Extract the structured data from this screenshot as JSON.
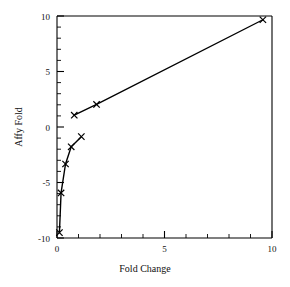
{
  "chart_data": {
    "type": "line",
    "title": "",
    "subtitle": "",
    "xlabel": "Fold  Change",
    "ylabel": "Affy Fold",
    "xlim": [
      0,
      10.6
    ],
    "ylim": [
      -10.5,
      10.2
    ],
    "grid": false,
    "legend": null,
    "legend_position": "none",
    "marker": "x",
    "xticks": [
      0,
      5,
      10
    ],
    "xtick_labels": [
      "0",
      "5",
      "10"
    ],
    "x_minor_ticks": [
      1,
      2,
      3,
      4,
      6,
      7,
      8,
      9
    ],
    "yticks": [
      10,
      5,
      0,
      -5,
      -10
    ],
    "ytick_labels": [
      "10",
      "5",
      "0",
      "-5",
      "-10"
    ],
    "y_minor_ticks": [
      9,
      8,
      7,
      6,
      4,
      3,
      2,
      1,
      -1,
      -2,
      -3,
      -4,
      -6,
      -7,
      -8,
      -9
    ],
    "series": [
      {
        "name": "upregulated",
        "points": [
          {
            "x": 0.85,
            "y": 0.95
          },
          {
            "x": 1.95,
            "y": 1.95
          },
          {
            "x": 10.15,
            "y": 9.85
          }
        ]
      },
      {
        "name": "downregulated",
        "points": [
          {
            "x": 0.12,
            "y": -10.0
          },
          {
            "x": 0.2,
            "y": -6.3
          },
          {
            "x": 0.42,
            "y": -3.6
          },
          {
            "x": 0.7,
            "y": -2.0
          },
          {
            "x": 1.2,
            "y": -1.05
          }
        ]
      }
    ],
    "annotations": []
  },
  "figure": {
    "background_color": "#ffffff",
    "axis_color": "#000000",
    "line_color": "#000000"
  }
}
